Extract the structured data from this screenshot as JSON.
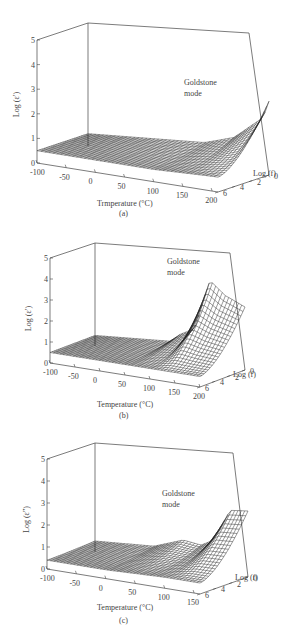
{
  "figure": {
    "panels": [
      {
        "id": "a",
        "caption": "(a)",
        "ylabel": "Log (ε′)",
        "xlabel": "Trmperature (°C)",
        "zlabel": "Log (f)",
        "annotation_line1": "Goldstone",
        "annotation_line2": "mode",
        "y_ticks": [
          "0",
          "1",
          "2",
          "3",
          "4",
          "5"
        ],
        "x_ticks": [
          "-100",
          "-50",
          "0",
          "50",
          "100",
          "150",
          "200"
        ],
        "f_ticks": [
          "0",
          "2",
          "4",
          "6"
        ]
      },
      {
        "id": "b",
        "caption": "(b)",
        "ylabel": "Log (ε′)",
        "xlabel": "Temperature (°C)",
        "zlabel": "Log (f)",
        "annotation_line1": "Goldstone",
        "annotation_line2": "mode",
        "y_ticks": [
          "0",
          "1",
          "2",
          "3",
          "4",
          "5"
        ],
        "x_ticks": [
          "-100",
          "-50",
          "0",
          "50",
          "100",
          "150",
          "200"
        ],
        "f_ticks": [
          "0",
          "2",
          "4",
          "6"
        ]
      },
      {
        "id": "c",
        "caption": "(c)",
        "ylabel": "Log (ε″)",
        "xlabel": "Temperature (°C)",
        "zlabel": "Log (f)",
        "annotation_line1": "Goldstone",
        "annotation_line2": "mode",
        "y_ticks": [
          "0",
          "1",
          "2",
          "3",
          "4",
          "5"
        ],
        "x_ticks": [
          "-100",
          "-50",
          "0",
          "50",
          "100",
          "150"
        ],
        "f_ticks": [
          "0",
          "2",
          "4",
          "6"
        ]
      }
    ]
  },
  "chart_data": [
    {
      "type": "surface3d",
      "title": "(a)",
      "xlabel": "Trmperature (°C)",
      "ylabel": "Log (f)",
      "zlabel": "Log (ε′)",
      "x_range": [
        -100,
        210
      ],
      "y_range": [
        0,
        6
      ],
      "z_range": [
        0,
        5
      ],
      "annotation": "Goldstone mode",
      "grid": true,
      "description": "Nearly flat surface at Log(ε′)≈0.5–1 across temperature; rises toward ≈3 at highest temperature (≈200 °C) and low frequency (Log f≈0), labeled Goldstone mode.",
      "profile_low_freq": {
        "x": [
          -100,
          -50,
          0,
          50,
          100,
          150,
          200,
          210
        ],
        "z": [
          0.5,
          0.6,
          0.7,
          0.8,
          0.9,
          1.3,
          2.3,
          3.0
        ]
      },
      "profile_high_freq": {
        "x": [
          -100,
          -50,
          0,
          50,
          100,
          150,
          200,
          210
        ],
        "z": [
          0.5,
          0.5,
          0.5,
          0.5,
          0.5,
          0.55,
          0.6,
          0.6
        ]
      }
    },
    {
      "type": "surface3d",
      "title": "(b)",
      "xlabel": "Temperature (°C)",
      "ylabel": "Log (f)",
      "zlabel": "Log (ε′)",
      "x_range": [
        -100,
        200
      ],
      "y_range": [
        0,
        6
      ],
      "z_range": [
        0,
        5
      ],
      "annotation": "Goldstone mode",
      "grid": true,
      "description": "Flat surface at Log(ε′)≈0.5–1 below ~60 °C with a small step near 60 °C; large Goldstone-mode peak ≈4 around 130 °C at low frequency, decreasing to ≈3 at 200 °C.",
      "profile_low_freq": {
        "x": [
          -100,
          -50,
          0,
          50,
          70,
          100,
          130,
          160,
          200
        ],
        "z": [
          0.5,
          0.6,
          0.7,
          0.8,
          1.2,
          1.6,
          4.0,
          3.4,
          3.0
        ]
      },
      "profile_high_freq": {
        "x": [
          -100,
          -50,
          0,
          50,
          100,
          150,
          200
        ],
        "z": [
          0.5,
          0.5,
          0.5,
          0.5,
          0.5,
          0.5,
          0.5
        ]
      }
    },
    {
      "type": "surface3d",
      "title": "(c)",
      "xlabel": "Temperature (°C)",
      "ylabel": "Log (f)",
      "zlabel": "Log (ε″)",
      "x_range": [
        -100,
        160
      ],
      "y_range": [
        0,
        6
      ],
      "z_range": [
        0,
        5
      ],
      "annotation": "Goldstone mode",
      "grid": true,
      "description": "Flat surface at Log(ε″)≈0.5–1 with a ridge near 50 °C; rises to ≈2.8–3 above ~100 °C at low frequency (Goldstone mode).",
      "profile_low_freq": {
        "x": [
          -100,
          -50,
          0,
          50,
          80,
          100,
          130,
          160
        ],
        "z": [
          0.5,
          0.6,
          0.7,
          1.2,
          1.1,
          1.4,
          2.9,
          3.0
        ]
      },
      "profile_high_freq": {
        "x": [
          -100,
          -50,
          0,
          50,
          100,
          150,
          160
        ],
        "z": [
          0.4,
          0.4,
          0.4,
          0.45,
          0.5,
          0.5,
          0.5
        ]
      }
    }
  ]
}
